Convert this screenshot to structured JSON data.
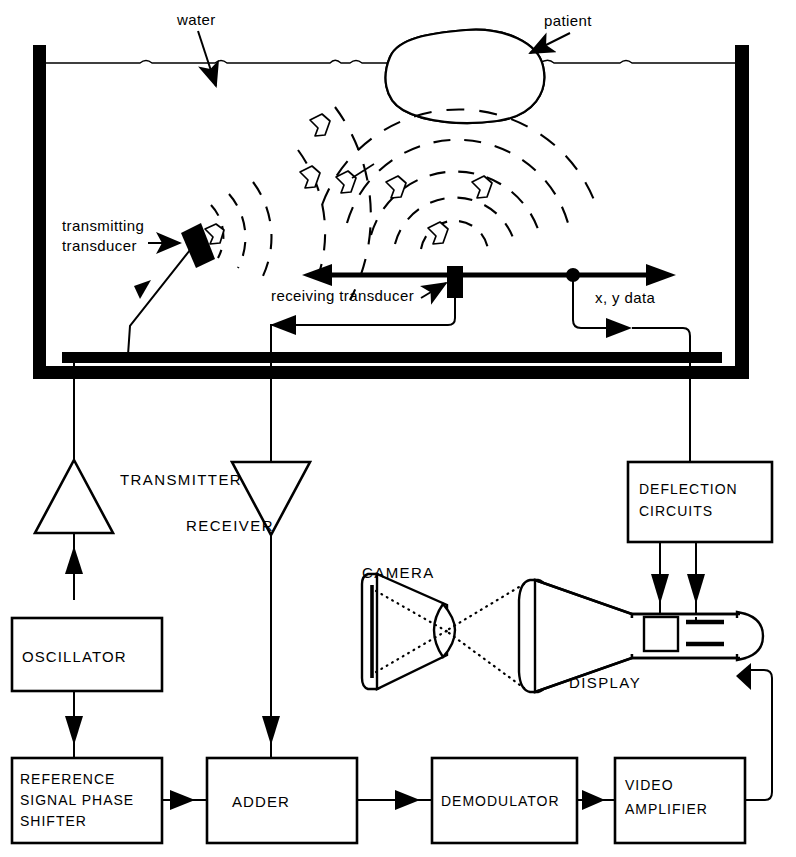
{
  "figure": {
    "type": "block-diagram",
    "width": 796,
    "height": 857,
    "ink_color": "#000000",
    "background_color": "#ffffff"
  },
  "annotations": {
    "water": "water",
    "patient": "patient",
    "transmitting_transducer_line1": "transmitting",
    "transmitting_transducer_line2": "transducer",
    "receiving_transducer": "receiving  transducer",
    "xy_data": "x, y data"
  },
  "components": {
    "transmitter": "TRANSMITTER",
    "receiver": "RECEIVER",
    "camera": "CAMERA",
    "display": "DISPLAY"
  },
  "blocks": [
    {
      "id": "oscillator",
      "label": "OSCILLATOR",
      "lines": [
        "OSCILLATOR"
      ]
    },
    {
      "id": "reference-signal-phase-shifter",
      "label": "REFERENCE SIGNAL PHASE SHIFTER",
      "lines": [
        "REFERENCE",
        "SIGNAL  PHASE",
        "SHIFTER"
      ]
    },
    {
      "id": "adder",
      "label": "ADDER",
      "lines": [
        "ADDER"
      ]
    },
    {
      "id": "demodulator",
      "label": "DEMODULATOR",
      "lines": [
        "DEMODULATOR"
      ]
    },
    {
      "id": "video-amplifier",
      "label": "VIDEO AMPLIFIER",
      "lines": [
        "VIDEO",
        "AMPLIFIER"
      ]
    },
    {
      "id": "deflection-circuits",
      "label": "DEFLECTION CIRCUITS",
      "lines": [
        "DEFLECTION",
        "CIRCUITS"
      ]
    }
  ],
  "signal_flow": [
    "oscillator -> reference signal phase shifter",
    "oscillator -> transmitter",
    "transmitter -> transmitting transducer",
    "transmitting transducer -> water -> patient -> receiving transducer",
    "receiving transducer -> receiver",
    "receiver -> adder",
    "reference signal phase shifter -> adder",
    "adder -> demodulator",
    "demodulator -> video amplifier",
    "video amplifier -> display",
    "x,y data -> deflection circuits",
    "deflection circuits -> display",
    "display -> camera"
  ]
}
